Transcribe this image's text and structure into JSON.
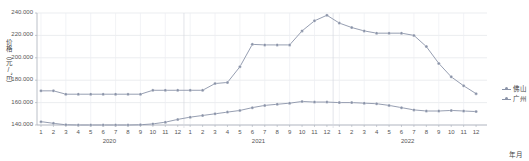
{
  "chart_data": {
    "type": "line",
    "title": "",
    "xlabel": "年月",
    "ylabel": "价格（元/㎡）",
    "ylim": [
      140000,
      240000
    ],
    "yticks": [
      "140.000",
      "160.000",
      "180.000",
      "200.000",
      "220.000",
      "240.000"
    ],
    "ytick_values": [
      140000,
      160000,
      180000,
      200000,
      220000,
      240000
    ],
    "grid": true,
    "legend_position": "right",
    "year_groups": [
      {
        "label": "2020",
        "months": [
          "1",
          "2",
          "3",
          "4",
          "5",
          "6",
          "7",
          "8",
          "9",
          "10",
          "11",
          "12"
        ]
      },
      {
        "label": "2021",
        "months": [
          "1",
          "2",
          "3",
          "4",
          "5",
          "6",
          "7",
          "8",
          "9",
          "10",
          "11",
          "12"
        ]
      },
      {
        "label": "2022",
        "months": [
          "1",
          "2",
          "3",
          "4",
          "5",
          "6",
          "7",
          "8",
          "9",
          "10",
          "11",
          "12"
        ]
      }
    ],
    "x": [
      "2020-1",
      "2020-2",
      "2020-3",
      "2020-4",
      "2020-5",
      "2020-6",
      "2020-7",
      "2020-8",
      "2020-9",
      "2020-10",
      "2020-11",
      "2020-12",
      "2021-1",
      "2021-2",
      "2021-3",
      "2021-4",
      "2021-5",
      "2021-6",
      "2021-7",
      "2021-8",
      "2021-9",
      "2021-10",
      "2021-11",
      "2021-12",
      "2022-1",
      "2022-2",
      "2022-3",
      "2022-4",
      "2022-5",
      "2022-6",
      "2022-7",
      "2022-8",
      "2022-9",
      "2022-10",
      "2022-11",
      "2022-12"
    ],
    "series": [
      {
        "name": "佛山",
        "color": "#8a93a8",
        "values": [
          143000,
          141500,
          140200,
          140000,
          140000,
          140000,
          140000,
          140000,
          140200,
          141000,
          142500,
          145000,
          147000,
          148500,
          150000,
          151500,
          153000,
          155500,
          157500,
          158500,
          159500,
          161000,
          160500,
          160500,
          160000,
          160000,
          159500,
          159000,
          157500,
          155500,
          153500,
          152500,
          152500,
          153000,
          152500,
          152000
        ]
      },
      {
        "name": "广州",
        "color": "#8a93a8",
        "values": [
          170500,
          170500,
          167500,
          167500,
          167500,
          167500,
          167500,
          167500,
          167500,
          171000,
          171000,
          171000,
          171000,
          171000,
          177000,
          178000,
          192000,
          212000,
          211500,
          211500,
          211500,
          224000,
          233000,
          238000,
          231000,
          227000,
          224000,
          222000,
          222000,
          222000,
          220000,
          210000,
          195000,
          183000,
          175000,
          168000
        ]
      }
    ],
    "legend": [
      "佛山",
      "广州"
    ]
  }
}
